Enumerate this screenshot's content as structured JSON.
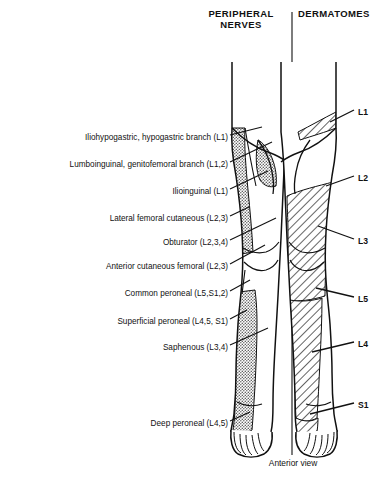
{
  "headers": {
    "left": "PERIPHERAL\nNERVES",
    "left_line1": "PERIPHERAL",
    "left_line2": "NERVES",
    "right": "DERMATOMES"
  },
  "caption": "Anterior view",
  "colors": {
    "ink": "#111111",
    "stipple_fill": "#9a9a9a",
    "hatch_line": "#111111",
    "background": "#ffffff"
  },
  "peripheral_nerves": [
    {
      "label": "Iliohypogastric, hypogastric branch (L1)",
      "right_x": 228,
      "y": 138
    },
    {
      "label": "Lumboinguinal, genitofemoral branch (L1,2)",
      "right_x": 228,
      "y": 165
    },
    {
      "label": "Ilioinguinal (L1)",
      "right_x": 228,
      "y": 192
    },
    {
      "label": "Lateral femoral cutaneous (L2,3)",
      "right_x": 228,
      "y": 219
    },
    {
      "label": "Obturator (L2,3,4)",
      "right_x": 228,
      "y": 243
    },
    {
      "label": "Anterior cutaneous femoral (L2,3)",
      "right_x": 228,
      "y": 267
    },
    {
      "label": "Common peroneal  (L5,S1,2)",
      "right_x": 228,
      "y": 294
    },
    {
      "label": "Superficial peroneal (L4,5, S1)",
      "right_x": 228,
      "y": 322
    },
    {
      "label": "Saphenous (L3,4)",
      "right_x": 228,
      "y": 348
    },
    {
      "label": "Deep peroneal (L4,5)",
      "right_x": 228,
      "y": 424
    }
  ],
  "dermatomes": [
    {
      "label": "L1",
      "x": 358,
      "y": 112
    },
    {
      "label": "L2",
      "x": 358,
      "y": 178
    },
    {
      "label": "L3",
      "x": 358,
      "y": 241
    },
    {
      "label": "L5",
      "x": 358,
      "y": 299
    },
    {
      "label": "L4",
      "x": 358,
      "y": 344
    },
    {
      "label": "S1",
      "x": 358,
      "y": 405
    }
  ]
}
